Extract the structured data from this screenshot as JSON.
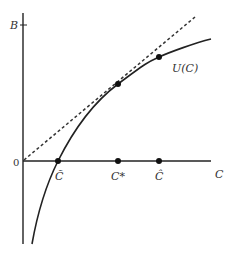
{
  "diagram": {
    "y_axis": {
      "label": "B",
      "origin_label": "0"
    },
    "x_axis": {
      "label": "C"
    },
    "curve": {
      "label": "U(C)"
    },
    "points": [
      {
        "name": "c-tilde",
        "label": "C̃",
        "desc": "curve crosses horizontal axis"
      },
      {
        "name": "c-star",
        "label": "C*",
        "desc": "tangency point of dashed line"
      },
      {
        "name": "c-hat",
        "label": "Ĉ",
        "desc": "point on curve"
      }
    ],
    "tangent_line": {
      "style": "dashed",
      "from": "origin"
    },
    "colors": {
      "line": "#222222",
      "text": "#333333",
      "background": "#ffffff"
    }
  }
}
